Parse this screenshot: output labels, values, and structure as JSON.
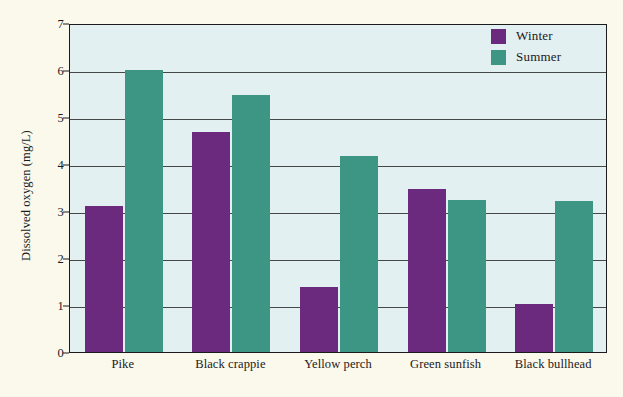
{
  "chart_data": {
    "type": "bar",
    "title": "",
    "xlabel": "",
    "ylabel": "Dissolved oxygen (mg/L)",
    "categories": [
      "Pike",
      "Black crappie",
      "Yellow perch",
      "Green sunfish",
      "Black bullhead"
    ],
    "series": [
      {
        "name": "Winter",
        "color": "#6b2a7e",
        "values": [
          3.1,
          4.68,
          1.38,
          3.46,
          1.02
        ]
      },
      {
        "name": "Summer",
        "color": "#3d9583",
        "values": [
          6.0,
          5.47,
          4.16,
          3.24,
          3.22
        ]
      }
    ],
    "ylim": [
      0,
      7
    ],
    "yticks": [
      0,
      1,
      2,
      3,
      4,
      5,
      6,
      7
    ],
    "ytick_labels": [
      "0",
      "1",
      "2",
      "3",
      "4",
      "5",
      "6",
      "7"
    ],
    "grid": true,
    "grid_axis": "y",
    "legend_position": "top-right",
    "plot_background": "#e3f0f1",
    "figure_background": "#fbf8ec"
  },
  "legend": {
    "items": [
      {
        "label": "Winter"
      },
      {
        "label": "Summer"
      }
    ]
  }
}
